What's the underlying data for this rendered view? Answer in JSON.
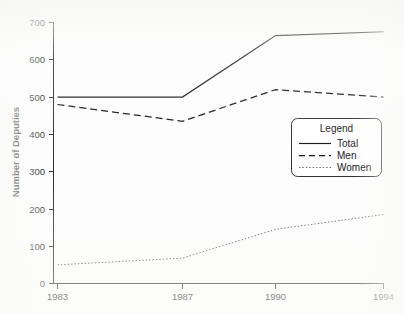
{
  "chart_data": {
    "type": "line",
    "title": "",
    "xlabel": "",
    "ylabel": "Number of Deputies",
    "x": [
      1983,
      1987,
      1990,
      1994
    ],
    "categories": [
      "1983",
      "1987",
      "1990",
      "1994"
    ],
    "xtick_labels": [
      "1983",
      "1987",
      "1990",
      "1994"
    ],
    "ytick_labels": [
      "0",
      "100",
      "200",
      "300",
      "400",
      "500",
      "600",
      "700"
    ],
    "yticks": [
      0,
      100,
      200,
      300,
      400,
      500,
      600,
      700
    ],
    "ylim": [
      0,
      700
    ],
    "xlim": [
      1983,
      1994
    ],
    "grid": false,
    "legend_position": "center-right",
    "series": [
      {
        "name": "Total",
        "style": "solid",
        "values": [
          500,
          500,
          665,
          675
        ]
      },
      {
        "name": "Men",
        "style": "dashed",
        "values": [
          480,
          435,
          520,
          500
        ]
      },
      {
        "name": "Women",
        "style": "dotted",
        "values": [
          50,
          68,
          145,
          185
        ]
      }
    ]
  },
  "legend": {
    "title": "Legend",
    "entries": [
      {
        "label": "Total"
      },
      {
        "label": "Men"
      },
      {
        "label": "Women"
      }
    ]
  },
  "axes": {
    "y_title": "Number of Deputies"
  }
}
